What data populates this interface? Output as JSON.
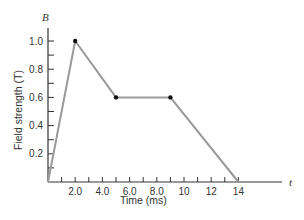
{
  "chart_data": {
    "type": "line",
    "title": "",
    "xlabel": "Time (ms)",
    "ylabel": "Field strength (T)",
    "x_axis_symbol": "t",
    "y_axis_symbol": "B",
    "xlim": [
      0,
      15
    ],
    "ylim": [
      0,
      1.1
    ],
    "x_ticks": [
      1,
      2,
      3,
      4,
      5,
      6,
      7,
      8,
      9,
      10,
      11,
      12,
      13,
      14
    ],
    "x_tick_labels": [
      "2.0",
      "4.0",
      "6.0",
      "8.0",
      "10",
      "12",
      "14"
    ],
    "x_tick_label_values": [
      2,
      4,
      6,
      8,
      10,
      12,
      14
    ],
    "y_ticks": [
      0.1,
      0.2,
      0.3,
      0.4,
      0.5,
      0.6,
      0.7,
      0.8,
      0.9,
      1.0
    ],
    "y_tick_labels": [
      "0.2",
      "0.4",
      "0.6",
      "0.8",
      "1.0"
    ],
    "y_tick_label_values": [
      0.2,
      0.4,
      0.6,
      0.8,
      1.0
    ],
    "grid": false,
    "legend": null,
    "series": [
      {
        "name": "B(t)",
        "x": [
          0,
          2,
          5,
          9,
          14
        ],
        "y": [
          0,
          1.0,
          0.6,
          0.6,
          0
        ],
        "color": "#999999",
        "markers_at": [
          [
            2,
            1.0
          ],
          [
            5,
            0.6
          ],
          [
            9,
            0.6
          ]
        ]
      }
    ]
  }
}
